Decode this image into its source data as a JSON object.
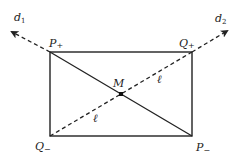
{
  "diagram": {
    "colors": {
      "stroke": "#222222",
      "background": "#ffffff"
    },
    "rectangle": {
      "x1": 50,
      "y1": 52,
      "x2": 192,
      "y2": 136
    },
    "points": {
      "P_plus": {
        "label": "P",
        "sub": "+",
        "x": 50,
        "y": 52
      },
      "Q_plus": {
        "label": "Q",
        "sub": "+",
        "x": 192,
        "y": 52
      },
      "Q_minus": {
        "label": "Q",
        "sub": "−",
        "x": 50,
        "y": 136
      },
      "P_minus": {
        "label": "P",
        "sub": "−",
        "x": 192,
        "y": 136
      },
      "M": {
        "label": "M",
        "x": 121,
        "y": 94
      }
    },
    "solid_diagonal": {
      "from": "P_plus",
      "to": "P_minus"
    },
    "dashed_line": {
      "from": "Q_minus",
      "to": "Q_plus",
      "segment_label": "ℓ"
    },
    "arrows": {
      "d1": {
        "label": "d",
        "sub": "1",
        "from": "P_plus",
        "tip_x": 10,
        "tip_y": 31
      },
      "d2": {
        "label": "d",
        "sub": "2",
        "from": "Q_plus",
        "tip_x": 229,
        "tip_y": 30
      }
    },
    "labels": {
      "ell_upper": "ℓ",
      "ell_lower": "ℓ"
    }
  }
}
